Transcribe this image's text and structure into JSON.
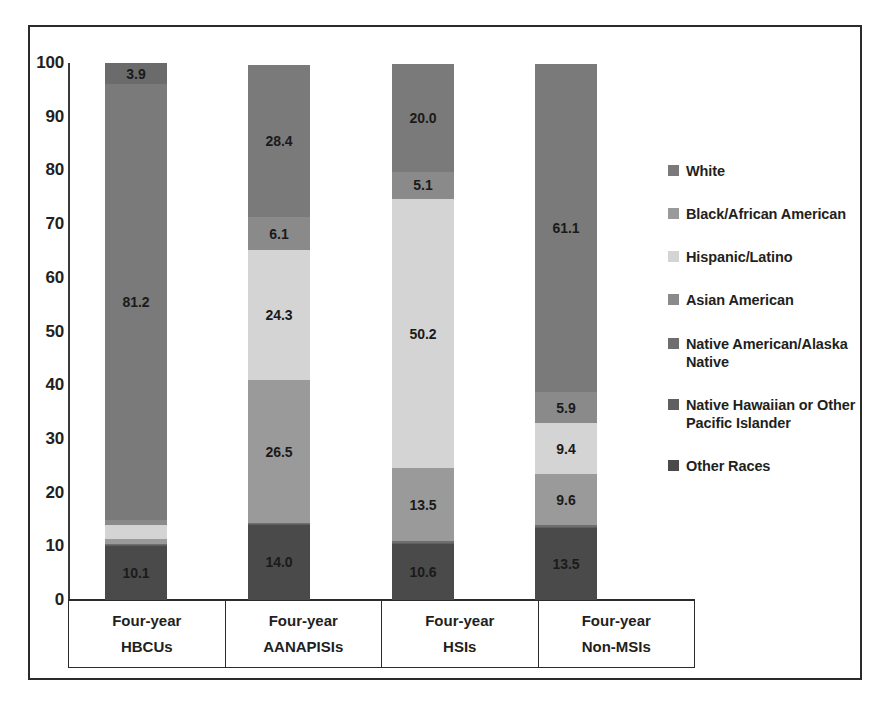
{
  "chart_data": {
    "type": "bar",
    "subtype": "stacked-bar-100",
    "title": "",
    "xlabel": "",
    "ylabel": "",
    "ylim": [
      0,
      100
    ],
    "yticks": [
      "0",
      "10",
      "20",
      "30",
      "40",
      "50",
      "60",
      "70",
      "80",
      "90",
      "100"
    ],
    "grid": false,
    "legend_position": "right",
    "categories": [
      "Four-year HBCUs",
      "Four-year AANAPISIs",
      "Four-year HSIs",
      "Four-year Non-MSIs"
    ],
    "category_lines": [
      [
        "Four-year",
        "HBCUs"
      ],
      [
        "Four-year",
        "AANAPISIs"
      ],
      [
        "Four-year",
        "HSIs"
      ],
      [
        "Four-year",
        "Non-MSIs"
      ]
    ],
    "series": [
      {
        "name": "Other Races",
        "color": "#4a4a4a",
        "values": [
          10.1,
          14.0,
          10.6,
          13.5
        ],
        "labels": [
          "10.1",
          "14.0",
          "10.6",
          "13.5"
        ]
      },
      {
        "name": "Native Hawaiian or Other Pacific Islander",
        "color": "#5f5f5f",
        "values": [
          0.1,
          0.1,
          0.1,
          0.1
        ],
        "labels": [
          "",
          "",
          "",
          ""
        ]
      },
      {
        "name": "Native American/Alaska Native",
        "color": "#6e6e6e",
        "values": [
          0.2,
          0.3,
          0.3,
          0.3
        ],
        "labels": [
          "",
          "",
          "",
          ""
        ]
      },
      {
        "name": "Black/African American",
        "color": "#9a9a9a",
        "values": [
          0.9,
          26.5,
          13.5,
          9.6
        ],
        "labels": [
          "",
          "26.5",
          "13.5",
          "9.6"
        ]
      },
      {
        "name": "Hispanic/Latino",
        "color": "#d4d4d4",
        "values": [
          2.7,
          24.3,
          50.2,
          9.4
        ],
        "labels": [
          "",
          "24.3",
          "50.2",
          "9.4"
        ]
      },
      {
        "name": "Asian American",
        "color": "#8a8a8a",
        "values": [
          0.9,
          6.1,
          5.1,
          5.9
        ],
        "labels": [
          "",
          "6.1",
          "5.1",
          "5.9"
        ]
      },
      {
        "name": "White",
        "color": "#7a7a7a",
        "values": [
          81.2,
          28.4,
          20.0,
          61.1
        ],
        "labels": [
          "81.2",
          "28.4",
          "20.0",
          "61.1"
        ]
      },
      {
        "name": "Top Other",
        "color": "#6b6b6b",
        "values": [
          3.9,
          0.0,
          0.0,
          0.0
        ],
        "labels": [
          "3.9",
          "",
          "",
          ""
        ]
      }
    ],
    "bar_values": {
      "Four-year HBCUs": {
        "Other Races": "10.1",
        "White": "81.2",
        "Top": "3.9"
      },
      "Four-year AANAPISIs": {
        "Other Races": "14.0",
        "Black/African American": "26.5",
        "Hispanic/Latino": "24.3",
        "Asian American": "6.1",
        "White": "28.4"
      },
      "Four-year HSIs": {
        "Other Races": "10.6",
        "Black/African American": "13.5",
        "Hispanic/Latino": "50.2",
        "Asian American": "5.1",
        "White": "20.0"
      },
      "Four-year Non-MSIs": {
        "Other Races": "13.5",
        "Black/African American": "9.6",
        "Hispanic/Latino": "9.4",
        "Asian American": "5.9",
        "White": "61.1"
      }
    }
  },
  "legend": {
    "items": [
      {
        "label": "White",
        "color": "#7a7a7a"
      },
      {
        "label": "Black/African American",
        "color": "#9a9a9a"
      },
      {
        "label": "Hispanic/Latino",
        "color": "#d4d4d4"
      },
      {
        "label": "Asian American",
        "color": "#8a8a8a"
      },
      {
        "label": "Native American/Alaska Native",
        "color": "#6e6e6e"
      },
      {
        "label": "Native Hawaiian or Other Pacific Islander",
        "color": "#5f5f5f"
      },
      {
        "label": "Other Races",
        "color": "#4a4a4a"
      }
    ]
  },
  "axis": {
    "y_ticks": [
      "100",
      "90",
      "80",
      "70",
      "60",
      "50",
      "40",
      "30",
      "20",
      "10",
      "0"
    ]
  }
}
